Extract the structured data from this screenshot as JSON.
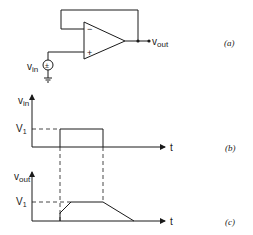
{
  "circuit": {
    "input_label": "v",
    "input_subscript": "in",
    "output_label": "v",
    "output_subscript": "out",
    "minus_sign": "−",
    "plus_sign": "+",
    "source_symbol": "±",
    "caption": "(a)"
  },
  "input_plot": {
    "ylabel": "v",
    "ylabel_subscript": "in",
    "level_label": "V",
    "level_subscript": "1",
    "xlabel": "t",
    "caption": "(b)"
  },
  "output_plot": {
    "ylabel": "v",
    "ylabel_subscript": "out",
    "level_label": "V",
    "level_subscript": "1",
    "xlabel": "t",
    "caption": "(c)"
  }
}
